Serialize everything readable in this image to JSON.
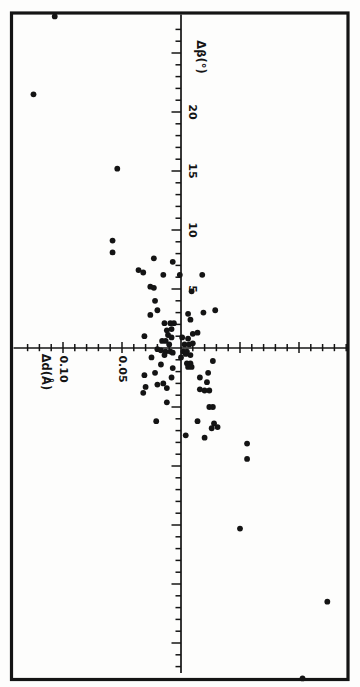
{
  "colors": {
    "ink": "#141414",
    "paper": "#fdfdfc"
  },
  "chart_data": {
    "type": "scatter",
    "title": "",
    "marker": "filled-circle",
    "layout_note": "figure rotated 90deg on page: beta axis runs vertically (positive up), d axis runs horizontally (positive left); all text rotated 90deg clockwise",
    "beta_axis": {
      "label": "Δβ(°)",
      "minor_tick_step": 1,
      "major_tick_step": 5,
      "range": [
        -27,
        27
      ],
      "labeled_ticks": [
        {
          "value": 20,
          "label": "20"
        },
        {
          "value": 15,
          "label": "15"
        },
        {
          "value": 10,
          "label": "10"
        },
        {
          "value": 5,
          "label": "5"
        }
      ]
    },
    "d_axis": {
      "label": "Δd(Å)",
      "minor_tick_step": 0.01,
      "major_tick_step": 0.05,
      "range": [
        -0.14,
        0.13
      ],
      "labeled_ticks": [
        {
          "value": 0.1,
          "label": "0.10"
        },
        {
          "value": 0.05,
          "label": "0.05"
        }
      ]
    },
    "point_format": [
      "delta_d_angstrom",
      "delta_beta_degrees"
    ],
    "points": [
      [
        0.107,
        28.1
      ],
      [
        0.125,
        21.5
      ],
      [
        0.054,
        15.2
      ],
      [
        0.058,
        9.1
      ],
      [
        0.058,
        8.1
      ],
      [
        0.023,
        7.6
      ],
      [
        0.007,
        7.3
      ],
      [
        0.036,
        6.6
      ],
      [
        0.032,
        6.4
      ],
      [
        0.015,
        6.2
      ],
      [
        0.001,
        6.2
      ],
      [
        -0.018,
        6.2
      ],
      [
        0.026,
        5.2
      ],
      [
        0.023,
        5.1
      ],
      [
        -0.009,
        4.8
      ],
      [
        0.022,
        4.0
      ],
      [
        0.02,
        3.2
      ],
      [
        0.026,
        2.8
      ],
      [
        -0.006,
        2.9
      ],
      [
        -0.019,
        3.0
      ],
      [
        -0.029,
        3.2
      ],
      [
        -0.008,
        2.4
      ],
      [
        0.014,
        2.1
      ],
      [
        0.009,
        2.1
      ],
      [
        0.006,
        2.1
      ],
      [
        0.008,
        1.6
      ],
      [
        0.012,
        1.5
      ],
      [
        0.031,
        1.0
      ],
      [
        -0.01,
        1.2
      ],
      [
        -0.014,
        1.3
      ],
      [
        -0.006,
        0.8
      ],
      [
        -0.001,
        0.9
      ],
      [
        0.011,
        1.1
      ],
      [
        0.008,
        0.9
      ],
      [
        0.016,
        0.6
      ],
      [
        0.013,
        0.6
      ],
      [
        0.01,
        0.3
      ],
      [
        -0.003,
        0.3
      ],
      [
        -0.007,
        0.3
      ],
      [
        -0.01,
        0.4
      ],
      [
        0.02,
        -0.1
      ],
      [
        0.017,
        -0.2
      ],
      [
        0.013,
        -0.3
      ],
      [
        0.009,
        -0.3
      ],
      [
        0.007,
        -0.4
      ],
      [
        -0.002,
        -0.3
      ],
      [
        -0.005,
        -0.3
      ],
      [
        0.0,
        -0.8
      ],
      [
        0.025,
        -0.8
      ],
      [
        0.014,
        -0.6
      ],
      [
        0.017,
        -1.4
      ],
      [
        -0.004,
        -0.5
      ],
      [
        -0.008,
        -0.6
      ],
      [
        -0.005,
        -1.3
      ],
      [
        -0.008,
        -1.3
      ],
      [
        -0.006,
        -1.6
      ],
      [
        -0.009,
        -1.6
      ],
      [
        -0.027,
        -1.1
      ],
      [
        0.007,
        -1.7
      ],
      [
        0.022,
        -2.1
      ],
      [
        0.031,
        -2.3
      ],
      [
        0.008,
        -2.5
      ],
      [
        0.015,
        -3.0
      ],
      [
        -0.016,
        -2.5
      ],
      [
        -0.023,
        -2.1
      ],
      [
        -0.022,
        -2.9
      ],
      [
        0.012,
        -3.4
      ],
      [
        0.03,
        -3.3
      ],
      [
        0.02,
        -3.1
      ],
      [
        0.032,
        -3.8
      ],
      [
        -0.016,
        -3.5
      ],
      [
        -0.02,
        -3.6
      ],
      [
        -0.024,
        -3.6
      ],
      [
        0.012,
        -4.6
      ],
      [
        -0.024,
        -5.0
      ],
      [
        -0.027,
        -5.0
      ],
      [
        0.021,
        -6.2
      ],
      [
        -0.014,
        -6.2
      ],
      [
        -0.028,
        -6.4
      ],
      [
        -0.031,
        -6.7
      ],
      [
        -0.026,
        -6.8
      ],
      [
        -0.004,
        -7.4
      ],
      [
        -0.02,
        -7.6
      ],
      [
        -0.056,
        -8.1
      ],
      [
        -0.056,
        -9.4
      ],
      [
        -0.05,
        -15.3
      ],
      [
        -0.124,
        -21.5
      ],
      [
        -0.103,
        -28.0
      ]
    ]
  }
}
